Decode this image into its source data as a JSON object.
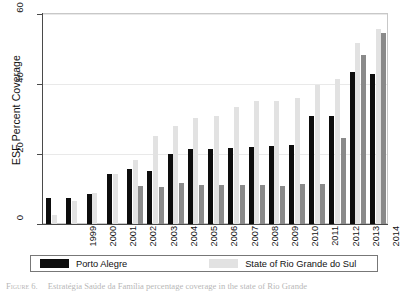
{
  "chart_data": {
    "type": "bar",
    "title": "",
    "xlabel": "",
    "ylabel": "ESF Percent Coverage",
    "ylim": [
      0,
      60
    ],
    "yticks": [
      0,
      20,
      40,
      60
    ],
    "grid": true,
    "legend_position": "bottom",
    "categories": [
      "1999",
      "2000",
      "2001",
      "2002",
      "2003",
      "2004",
      "2005",
      "2006",
      "2007",
      "2008",
      "2009",
      "2010",
      "2011",
      "2012",
      "2013",
      "2014",
      "2015"
    ],
    "series": [
      {
        "name": "Porto Alegre",
        "color": "#0d0d0d",
        "values": [
          7.5,
          7.5,
          8.7,
          14.2,
          15.7,
          15.1,
          20.1,
          21.3,
          21.5,
          21.8,
          22.0,
          22.2,
          22.7,
          31.0,
          30.8,
          43.4,
          43.0
        ]
      },
      {
        "name": "State of Rio Grande do Sul",
        "color": "#e2e2e2",
        "values": [
          2.6,
          6.6,
          9.0,
          14.3,
          18.4,
          25.1,
          27.9,
          30.3,
          30.8,
          33.5,
          35.1,
          35.2,
          36.1,
          39.8,
          41.3,
          51.8,
          55.7
        ]
      },
      {
        "name": "Canoas",
        "color": "#8a8a8a",
        "values": [
          null,
          null,
          null,
          null,
          10.8,
          10.6,
          11.6,
          11.2,
          11.2,
          11.1,
          11.1,
          11.0,
          11.3,
          11.3,
          24.6,
          48.2,
          54.6
        ]
      }
    ]
  },
  "axes": {
    "y_title": "ESF Percent Coverage",
    "y_tick_labels": [
      "0",
      "20",
      "40",
      "60"
    ],
    "x_tick_labels": [
      "1999",
      "2000",
      "2001",
      "2002",
      "2003",
      "2004",
      "2005",
      "2006",
      "2007",
      "2008",
      "2009",
      "2010",
      "2011",
      "2012",
      "2013",
      "2014",
      "2015"
    ]
  },
  "legend": {
    "entries": [
      {
        "label": "Porto Alegre",
        "swatch": "s0"
      },
      {
        "label": "State of Rio Grande do Sul",
        "swatch": "s1"
      },
      {
        "label": "Canoas",
        "swatch": "s2"
      }
    ]
  },
  "caption": {
    "label": "Figure 6.",
    "text": "Estratégia Saúde da Família percentage coverage in the state of Rio Grande"
  }
}
